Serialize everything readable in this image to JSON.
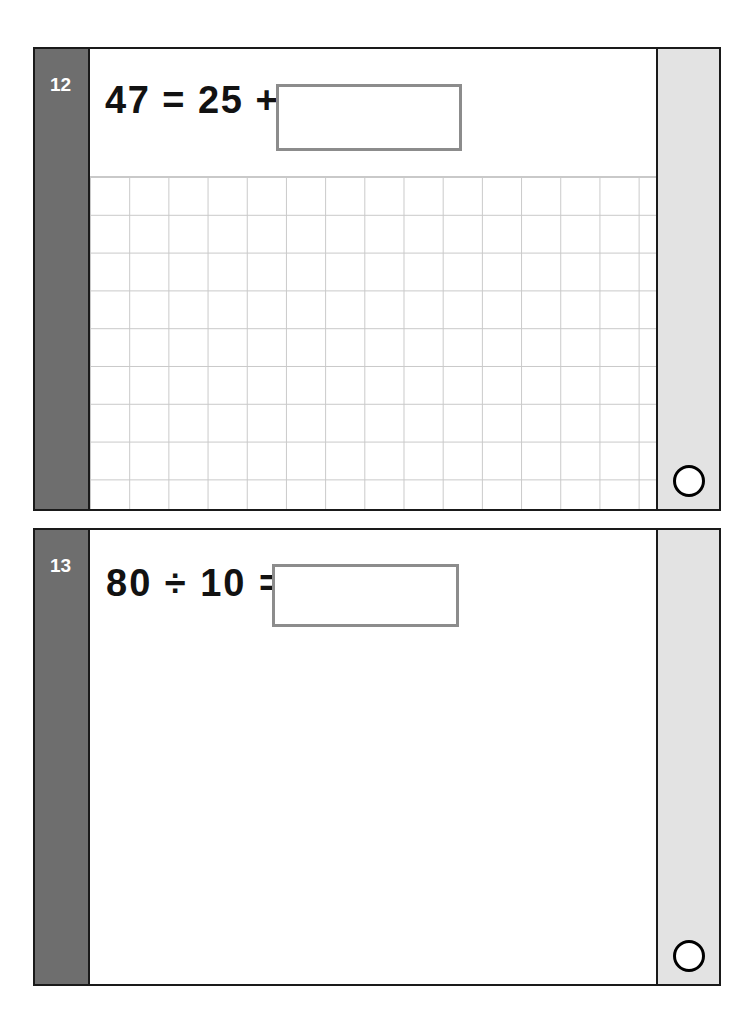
{
  "worksheet": {
    "page_background": "#ffffff",
    "card_border_color": "#1a1a1a",
    "number_band_color": "#6e6e6e",
    "mark_band_color": "#e3e3e3",
    "answer_box_border_color": "#8c8c8c",
    "grid_line_color": "#c9c9c9"
  },
  "cards": [
    {
      "number": "12",
      "expression": "47 = 25 +",
      "answer_value": "",
      "answer_placeholder": "",
      "has_working_grid": true,
      "grid_columns": 15,
      "grid_rows": 9,
      "mark_circle": "mark-circle"
    },
    {
      "number": "13",
      "expression": "80 ÷ 10 =",
      "answer_value": "",
      "answer_placeholder": "",
      "has_working_grid": false,
      "grid_columns": 0,
      "grid_rows": 0,
      "mark_circle": "mark-circle"
    }
  ]
}
